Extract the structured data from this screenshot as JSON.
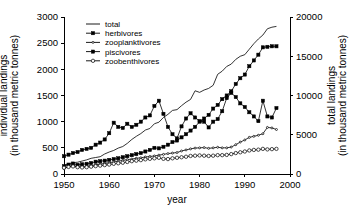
{
  "chart_data": {
    "type": "line",
    "title": "",
    "xlabel": "year",
    "ylabel": "individual landings\n(in thousand metric tonnes)",
    "y2label": "total landings\n(in thousand metric tonnes)",
    "xlim": [
      1950,
      2000
    ],
    "ylim": [
      0,
      3000
    ],
    "y2lim": [
      0,
      20000
    ],
    "xticks": [
      1950,
      1960,
      1970,
      1980,
      1990,
      2000
    ],
    "xtick_labels": [
      "1950",
      "1960",
      "1970",
      "1980",
      "1990",
      "2000"
    ],
    "yticks": [
      0,
      500,
      1000,
      1500,
      2000,
      2500,
      3000
    ],
    "ytick_labels": [
      "0",
      "500",
      "1000",
      "1500",
      "2000",
      "2500",
      "3000"
    ],
    "y2ticks": [
      0,
      5000,
      10000,
      15000,
      20000
    ],
    "y2tick_labels": [
      "0",
      "5000",
      "10000",
      "15000",
      "20000"
    ],
    "grid": false,
    "legend_position": "top-left-inside",
    "x": [
      1950,
      1951,
      1952,
      1953,
      1954,
      1955,
      1956,
      1957,
      1958,
      1959,
      1960,
      1961,
      1962,
      1963,
      1964,
      1965,
      1966,
      1967,
      1968,
      1969,
      1970,
      1971,
      1972,
      1973,
      1974,
      1975,
      1976,
      1977,
      1978,
      1979,
      1980,
      1981,
      1982,
      1983,
      1984,
      1985,
      1986,
      1987,
      1988,
      1989,
      1990,
      1991,
      1992,
      1993,
      1994,
      1995,
      1996,
      1997
    ],
    "series": [
      {
        "name": "total",
        "axis": "right",
        "marker": "none",
        "values": [
          1100,
          1300,
          1450,
          1500,
          1650,
          1800,
          2000,
          2100,
          2200,
          2550,
          2800,
          3000,
          3300,
          3500,
          3900,
          4400,
          4800,
          5150,
          5600,
          5800,
          6400,
          6600,
          7200,
          7600,
          8100,
          8200,
          8700,
          9150,
          9500,
          10600,
          10400,
          10700,
          10900,
          11300,
          12700,
          13100,
          13700,
          14000,
          14600,
          15000,
          15200,
          15900,
          16600,
          17200,
          17700,
          18500,
          18700,
          18800
        ]
      },
      {
        "name": "herbivores",
        "axis": "left",
        "marker": "filled-square",
        "values": [
          150,
          180,
          200,
          175,
          185,
          195,
          210,
          235,
          245,
          255,
          270,
          285,
          300,
          320,
          340,
          360,
          380,
          400,
          430,
          460,
          500,
          490,
          520,
          560,
          610,
          640,
          700,
          760,
          830,
          900,
          1000,
          1060,
          1130,
          1250,
          1320,
          1430,
          1500,
          1580,
          1720,
          1830,
          1900,
          2060,
          2170,
          2280,
          2420,
          2430,
          2440,
          2440
        ]
      },
      {
        "name": "zooplanktivores",
        "axis": "left",
        "marker": "dot-small",
        "values": [
          100,
          140,
          160,
          140,
          130,
          145,
          160,
          175,
          190,
          200,
          215,
          230,
          245,
          260,
          275,
          285,
          300,
          310,
          325,
          335,
          345,
          360,
          375,
          390,
          400,
          410,
          440,
          460,
          480,
          495,
          500,
          505,
          490,
          500,
          510,
          500,
          500,
          515,
          560,
          610,
          650,
          700,
          720,
          740,
          770,
          890,
          880,
          850
        ]
      },
      {
        "name": "piscivores",
        "axis": "left",
        "marker": "filled-square",
        "values": [
          340,
          370,
          400,
          420,
          460,
          480,
          500,
          560,
          600,
          660,
          780,
          980,
          900,
          880,
          960,
          900,
          940,
          1000,
          1080,
          1120,
          1300,
          1400,
          1150,
          900,
          760,
          680,
          910,
          1060,
          1160,
          1080,
          1010,
          1000,
          890,
          1000,
          1050,
          1200,
          1450,
          1550,
          1470,
          1350,
          1280,
          1180,
          1100,
          1010,
          1400,
          1100,
          1080,
          1260
        ]
      },
      {
        "name": "zoobenthivores",
        "axis": "left",
        "marker": "open-circle",
        "values": [
          120,
          135,
          145,
          130,
          125,
          130,
          140,
          150,
          160,
          170,
          180,
          195,
          205,
          215,
          230,
          245,
          255,
          265,
          280,
          290,
          300,
          310,
          290,
          285,
          300,
          310,
          320,
          330,
          345,
          350,
          355,
          350,
          345,
          350,
          360,
          360,
          365,
          380,
          400,
          415,
          430,
          450,
          460,
          465,
          480,
          470,
          475,
          480
        ]
      }
    ],
    "legend": [
      {
        "label": "total",
        "marker": "none"
      },
      {
        "label": "herbivores",
        "marker": "filled-square"
      },
      {
        "label": "zooplanktivores",
        "marker": "dot-small"
      },
      {
        "label": "piscivores",
        "marker": "filled-square"
      },
      {
        "label": "zoobenthivores",
        "marker": "open-circle"
      }
    ]
  }
}
